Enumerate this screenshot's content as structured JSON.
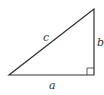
{
  "diagram": {
    "type": "right-triangle",
    "labels": {
      "hypotenuse": "c",
      "vertical_leg": "b",
      "horizontal_leg": "a"
    },
    "vertices": {
      "bottom_left": [
        9,
        75
      ],
      "bottom_right": [
        94,
        75
      ],
      "top_right": [
        94,
        9
      ]
    },
    "right_angle_marker": "bottom-right",
    "colors": {
      "stroke": "#333333",
      "background": "#ffffff"
    }
  }
}
